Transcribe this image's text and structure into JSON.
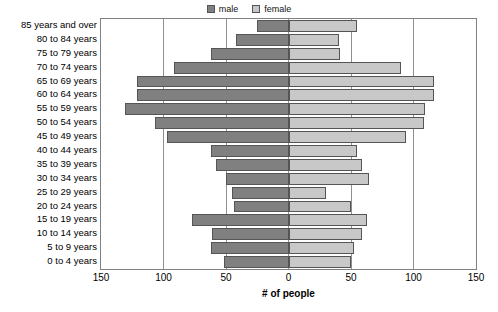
{
  "legend": {
    "position": "top-center",
    "entries": [
      {
        "label": "male",
        "color": "#808080",
        "icon": "square-swatch-icon"
      },
      {
        "label": "female",
        "color": "#c8c8c8",
        "icon": "square-swatch-icon"
      }
    ]
  },
  "axis": {
    "x_title": "# of people",
    "x_ticks": [
      "150",
      "100",
      "50",
      "0",
      "50",
      "100",
      "150"
    ],
    "x_tick_values": [
      -150,
      -100,
      -50,
      0,
      50,
      100,
      150
    ],
    "x_min": -150,
    "x_max": 150,
    "gridlines": [
      -100,
      -50,
      0,
      50,
      100
    ]
  },
  "chart_data": {
    "type": "bar",
    "subtype": "population-pyramid",
    "title": "",
    "xlabel": "# of people",
    "ylabel": "",
    "xlim": [
      -150,
      150
    ],
    "grid": true,
    "legend_position": "top-center",
    "orientation": "horizontal",
    "categories": [
      "0 to 4 years",
      "5 to 9 years",
      "10 to 14 years",
      "15 to 19 years",
      "20 to 24 years",
      "25 to 29 years",
      "30 to 34 years",
      "35 to 39 years",
      "40 to 44 years",
      "45 to 49 years",
      "50 to 54 years",
      "55 to 59 years",
      "60 to 64 years",
      "65 to 69 years",
      "70 to 74 years",
      "75 to 79 years",
      "80 to 84 years",
      "85 years and over"
    ],
    "series": [
      {
        "name": "male",
        "color": "#808080",
        "direction": "left",
        "values": [
          52,
          62,
          61,
          77,
          44,
          45,
          50,
          58,
          62,
          97,
          107,
          131,
          121,
          121,
          92,
          62,
          42,
          25
        ]
      },
      {
        "name": "female",
        "color": "#c8c8c8",
        "direction": "right",
        "values": [
          50,
          52,
          59,
          63,
          50,
          30,
          64,
          59,
          55,
          94,
          108,
          109,
          116,
          116,
          90,
          41,
          40,
          55
        ]
      }
    ]
  },
  "colors": {
    "male": "#808080",
    "female": "#c8c8c8",
    "bar_outline": "#555555",
    "frame": "#808080",
    "gridline": "#909090",
    "background": "#ffffff"
  }
}
